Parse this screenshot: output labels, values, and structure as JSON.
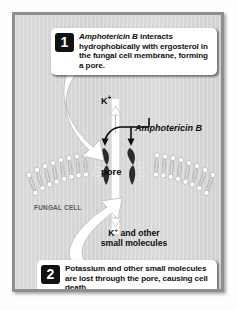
{
  "figure": {
    "background_color": "#d6d6d6",
    "frame_color": "#8f8f8f"
  },
  "steps": [
    {
      "number": "1",
      "text_parts": [
        {
          "style": "italic",
          "text": "Amphotericin B"
        },
        {
          "style": "normal",
          "text": " interacts hydrophobically with ergosterol in the fungal cell membrane, forming a pore."
        }
      ],
      "plain_text": "Amphotericin B interacts hydrophobically with ergosterol in the fungal cell membrane, forming a pore."
    },
    {
      "number": "2",
      "text_parts": [
        {
          "style": "normal",
          "text": "Potassium and other small molecules are lost through the pore, causing cell death."
        }
      ],
      "plain_text": "Potassium and other small molecules are lost through the pore, causing cell death."
    }
  ],
  "labels": {
    "potassium_top": "K",
    "potassium_top_charge": "+",
    "amphotericin": "Amphotericin B",
    "pore": "pore",
    "fungal_cell": "FUNGAL CELL",
    "efflux_line1_prefix": "K",
    "efflux_line1_charge": "+",
    "efflux_line1_suffix": " and other",
    "efflux_line2": "small molecules"
  },
  "diagram": {
    "membrane": {
      "type": "phospholipid-bilayer",
      "head_color": "#ffffff",
      "tail_color": "#b8b8b8",
      "left_leaflet_units": 13,
      "right_leaflet_units": 13,
      "curvature": "convex-upward arc interrupted at center by pore"
    },
    "pore": {
      "channel_color": "#ffffff",
      "molecule_color": "#2a2a2a",
      "molecule_shape": "hourglass",
      "molecule_count": 2,
      "description": "Amphotericin B-ergosterol complexes flanking an open aqueous channel"
    },
    "arrows": [
      {
        "name": "potassium-efflux-arrow",
        "color": "#ffffff",
        "direction": "up",
        "meaning": "K+ exits through pore"
      },
      {
        "name": "efflux-down-arrow",
        "color": "#ffffff",
        "direction": "down",
        "meaning": "small molecules lost"
      },
      {
        "name": "amphotericin-pointer-left",
        "color": "#111111",
        "direction": "down-left"
      },
      {
        "name": "amphotericin-pointer-right",
        "color": "#111111",
        "direction": "down"
      },
      {
        "name": "step1-callout-arrow",
        "color": "#ffffff",
        "direction": "down-right"
      },
      {
        "name": "step2-callout-arrow",
        "color": "#ffffff",
        "direction": "up-right"
      }
    ]
  }
}
